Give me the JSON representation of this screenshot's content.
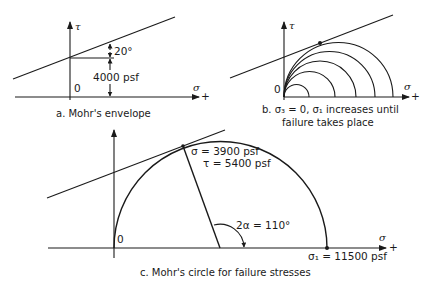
{
  "panels": {
    "a": {
      "caption": "a.  Mohr's envelope",
      "tau_label": "τ",
      "sigma_label": "σ",
      "plus_label": "+",
      "origin_label": "0",
      "angle_label": "20°",
      "intercept_label": "4000 psf"
    },
    "b": {
      "caption_line1": "b.  σ₃ = 0, σ₁ increases until",
      "caption_line2": "failure takes place",
      "tau_label": "τ",
      "sigma_label": "σ",
      "plus_label": "+",
      "origin_label": "0"
    },
    "c": {
      "caption": "c.  Mohr's circle for failure stresses",
      "tau_label": "τ",
      "sigma_label": "σ",
      "plus_label": "+",
      "origin_label": "0",
      "point_sigma_label": "σ = 3900 psf",
      "point_tau_label": "τ = 5400 psf",
      "angle_label": "2α = 110°",
      "sigma1_label": "σ₁ = 11500 psf"
    }
  },
  "values": {
    "cohesion_psf": 4000,
    "friction_angle_deg": 20,
    "failure_sigma_psf": 3900,
    "failure_tau_psf": 5400,
    "two_alpha_deg": 110,
    "sigma1_psf": 11500,
    "sigma3_psf": 0
  }
}
